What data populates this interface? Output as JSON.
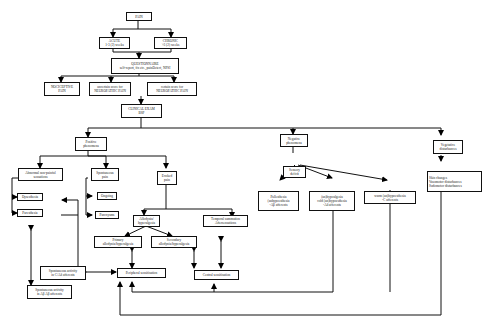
{
  "diagram": {
    "nodes": {
      "pain": "PAIN",
      "acute": "ACUTE\n1-3 (2) weeks",
      "chronic": "CHRONIC\n>3 (2) weeks",
      "questionnaire": "QUESTIONNAIRE\nself-report, fix etc., painDetect, NPSI",
      "nociceptive": "NOCICEPTIVE\nPAIN",
      "neuro_suspect": "uncertain score for\nNEUROPATHIC PAIN",
      "neuro_certain": "certain score for\nNEUROPATHIC PAIN",
      "clinical_exam": "CLINICAL EXAM\nBSP",
      "positive": "Positive\nphenomena",
      "abnormal_sens": "Abnormal non-painful\nsensations",
      "dysesthesia": "Dysesthesia",
      "paresthesia": "Paresthesia",
      "spontaneous": "Spontaneous\npain",
      "ongoing": "Ongoing",
      "paroxysms": "Paroxysms",
      "evoked": "Evoked\npain",
      "allodynia": "Allodynia/\nhyperalgesia",
      "temporal": "Temporal summation\nAftersensations",
      "primary": "Primary\nallodynia/hyperalgesia",
      "secondary": "Secondary\nallodynia/hyperalgesia",
      "spont_cmh": "Spontaneous activity\nin C/Aδ afferents",
      "spont_ab": "Spontaneous activity\nin Aβ Aβ afferents",
      "peripheral": "Peripheral sensitisation",
      "central": "Central sensitisation",
      "negative": "Negative\nphenomena",
      "sensory_deficit": "Sensory\ndeficit",
      "pallesthesia": "Pallesthesia\n(anhypoesthesia\n-Aβ afferents",
      "cold": "(an)hypoalgesia\ncold (an)hypoesthesia\n-Aδ afferents",
      "warm": "warm (an)hypoesthesia\n-C afferents",
      "vegetative": "Vegetative\ndisturbances",
      "skin": "Skin changes\nVasomotor disturbances\nSudomotor disturbances"
    }
  }
}
